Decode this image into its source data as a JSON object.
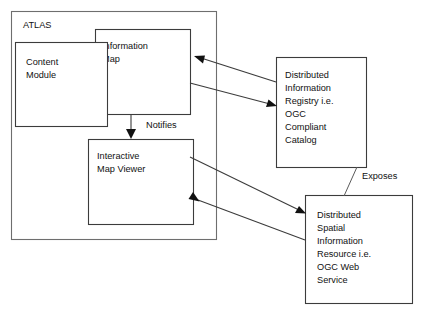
{
  "diagram": {
    "title_container": "ATLAS",
    "nodes": [
      {
        "id": "atlas",
        "label": "ATLAS",
        "kind": "container"
      },
      {
        "id": "content-module",
        "lines": [
          "Content",
          "Module"
        ],
        "line1": "Content",
        "line2": "Module"
      },
      {
        "id": "information-map",
        "lines": [
          "Information",
          "Map"
        ],
        "line1": "Information",
        "line2": "Map"
      },
      {
        "id": "interactive-map-viewer",
        "lines": [
          "Interactive",
          "Map Viewer"
        ],
        "line1": "Interactive",
        "line2": "Map Viewer"
      },
      {
        "id": "distributed-information-registry",
        "lines": [
          "Distributed",
          "Information",
          "Registry i.e.",
          "OGC",
          "Compliant",
          "Catalog"
        ],
        "line1": "Distributed",
        "line2": "Information",
        "line3": "Registry i.e.",
        "line4": "OGC",
        "line5": "Compliant",
        "line6": "Catalog"
      },
      {
        "id": "distributed-spatial-information-resource",
        "lines": [
          "Distributed",
          "Spatial",
          "Information",
          "Resource i.e.",
          "OGC Web",
          "Service"
        ],
        "line1": "Distributed",
        "line2": "Spatial",
        "line3": "Information",
        "line4": "Resource i.e.",
        "line5": "OGC Web",
        "line6": "Service"
      }
    ],
    "edge_labels": {
      "notifies": "Notifies",
      "exposes": "Exposes"
    },
    "colors": {
      "background": "#ffffff",
      "box_stroke": "#3c3c3c",
      "container_stroke": "#6e6e6e",
      "line_stroke": "#3c3c3c",
      "text": "#111111"
    }
  }
}
